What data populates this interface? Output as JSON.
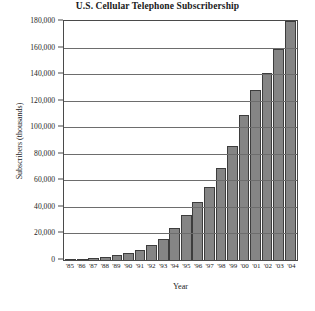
{
  "chart_data": {
    "type": "bar",
    "title": "U.S. Cellular Telephone Subscribership",
    "xlabel": "Year",
    "ylabel": "Subscribers (thousands)",
    "categories": [
      "'85",
      "'86",
      "'87",
      "'88",
      "'89",
      "'90",
      "'91",
      "'92",
      "'93",
      "'94",
      "'95",
      "'96",
      "'97",
      "'98",
      "'99",
      "'00",
      "'01",
      "'02",
      "'03",
      "'04"
    ],
    "values": [
      340,
      682,
      1231,
      2069,
      3509,
      5283,
      7557,
      11033,
      16009,
      24134,
      33786,
      44043,
      55312,
      69209,
      86047,
      109478,
      128375,
      140767,
      158722,
      180000
    ],
    "ylim": [
      0,
      180000
    ],
    "ytick_labels": [
      "180,000",
      "160,000",
      "140,000",
      "120,000",
      "100,000",
      "80,000",
      "60,000",
      "40,000",
      "20,000",
      "0"
    ],
    "ytick_values": [
      180000,
      160000,
      140000,
      120000,
      100000,
      80000,
      60000,
      40000,
      20000,
      0
    ],
    "grid": true,
    "legend": "none",
    "bar_color": "#858585",
    "bar_edge_color": "#3d3d3d",
    "grid_color": "#6d6d6d",
    "frame_color": "#4a4a4a"
  }
}
